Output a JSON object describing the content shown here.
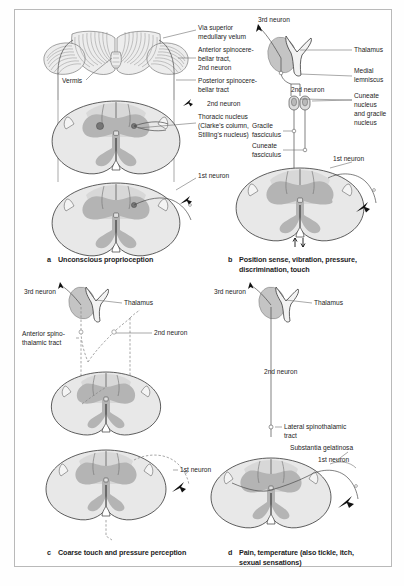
{
  "figure": {
    "background": "#ffffff",
    "frame_color": "#b9b9b9"
  },
  "panels": [
    {
      "letter": "a",
      "caption": "Unconscious proprioception",
      "labels": [
        "Via superior",
        "medullary velum",
        "Anterior spinocere-",
        "bellar tract,",
        "2nd neuron",
        "Posterior spinocere-",
        "bellar tract",
        "2nd neuron",
        "Thoracic nucleus",
        "(Clarke's column,",
        "Stilling's nucleus)",
        "1st neuron",
        "Vermis"
      ]
    },
    {
      "letter": "b",
      "caption_line1": "Position sense, vibration, pressure,",
      "caption_line2": "discrimination, touch",
      "labels": [
        "3rd neuron",
        "Thalamus",
        "Medial",
        "lemniscus",
        "2nd neuron",
        "Cuneate",
        "nucleus",
        "and gracile",
        "nucleus",
        "Gracile",
        "fasciculus",
        "Cuneate",
        "fasciculus",
        "1st neuron"
      ]
    },
    {
      "letter": "c",
      "caption": "Coarse touch and pressure perception",
      "labels": [
        "3rd neuron",
        "Thalamus",
        "Anterior spino-",
        "thalamic tract",
        "2nd neuron",
        "1st neuron"
      ]
    },
    {
      "letter": "d",
      "caption_line1": "Pain, temperature (also tickle, itch,",
      "caption_line2": "sexual sensations)",
      "labels": [
        "3rd neuron",
        "Thalamus",
        "2nd neuron",
        "Lateral spinothalamic",
        "tract",
        "Substantia gelatinosa",
        "1st neuron"
      ]
    }
  ],
  "panel_a": {
    "cerebellum_label_via_1": "Via superior",
    "cerebellum_label_via_2": "medullary velum",
    "ant_sct_1": "Anterior spinocere-",
    "ant_sct_2": "bellar tract,",
    "ant_sct_3": "2nd neuron",
    "post_sct_1": "Posterior spinocere-",
    "post_sct_2": "bellar tract",
    "second_neuron": "2nd neuron",
    "thoracic_1": "Thoracic nucleus",
    "thoracic_2": "(Clarke's column,",
    "thoracic_3": "Stilling's nucleus)",
    "first_neuron": "1st neuron",
    "vermis": "Vermis",
    "letter": "a",
    "caption": "Unconscious proprioception"
  },
  "panel_b": {
    "third_neuron": "3rd neuron",
    "thalamus": "Thalamus",
    "medial_1": "Medial",
    "medial_2": "lemniscus",
    "second_neuron": "2nd neuron",
    "cuneate_1": "Cuneate",
    "cuneate_2": "nucleus",
    "cuneate_3": "and gracile",
    "cuneate_4": "nucleus",
    "gracile_1": "Gracile",
    "gracile_2": "fasciculus",
    "cunfasc_1": "Cuneate",
    "cunfasc_2": "fasciculus",
    "first_neuron": "1st neuron",
    "letter": "b",
    "caption_1": "Position sense, vibration, pressure,",
    "caption_2": "discrimination, touch"
  },
  "panel_c": {
    "third_neuron": "3rd neuron",
    "thalamus": "Thalamus",
    "ast_1": "Anterior spino-",
    "ast_2": "thalamic tract",
    "second_neuron": "2nd neuron",
    "first_neuron": "1st neuron",
    "letter": "c",
    "caption": "Coarse touch and pressure perception"
  },
  "panel_d": {
    "third_neuron": "3rd neuron",
    "thalamus": "Thalamus",
    "second_neuron": "2nd neuron",
    "lst_1": "Lateral spinothalamic",
    "lst_2": "tract",
    "substantia": "Substantia gelatinosa",
    "first_neuron": "1st neuron",
    "letter": "d",
    "caption_1": "Pain, temperature (also tickle, itch,",
    "caption_2": "sexual sensations)"
  },
  "colors": {
    "cord_outline": "#e8e8e8",
    "gray_matter": "#b4b4b4",
    "white_matter": "#d8d8d8",
    "thalamus_fill": "#c4c4c4",
    "line": "#6e6e6e",
    "text": "#1d1d1d"
  }
}
